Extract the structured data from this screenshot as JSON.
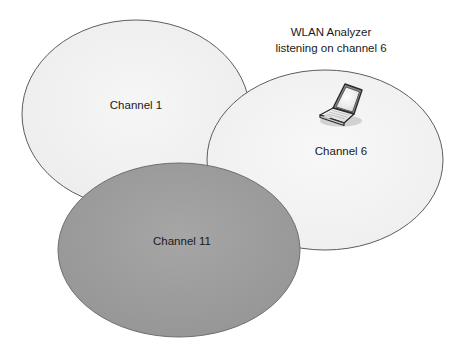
{
  "diagram": {
    "background_color": "#ffffff",
    "annotation": {
      "line1": "WLAN Analyzer",
      "line2": "listening on channel 6"
    },
    "cells": [
      {
        "id": "channel-1",
        "label": "Channel 1",
        "fill": "#f1f1f1",
        "stroke": "#595959",
        "cx": 136,
        "cy": 114,
        "rx": 114,
        "ry": 94,
        "label_x": 136,
        "label_y": 106
      },
      {
        "id": "channel-6",
        "label": "Channel 6",
        "fill": "#f4f4f4",
        "stroke": "#595959",
        "cx": 325,
        "cy": 160,
        "rx": 118,
        "ry": 90,
        "label_x": 341,
        "label_y": 152
      },
      {
        "id": "channel-11",
        "label": "Channel 11",
        "fill": "#9d9d9d",
        "stroke": "#6b6b6b",
        "cx": 179,
        "cy": 250,
        "rx": 121,
        "ry": 87,
        "label_x": 182,
        "label_y": 242
      }
    ],
    "device": {
      "name": "laptop",
      "x": 314,
      "y": 82,
      "width": 48,
      "height": 42,
      "screen_fill": "#e9e9e9",
      "body_fill": "#f6f6f6",
      "outline": "#2b2b2b",
      "shadow": "#c9c9c9"
    }
  }
}
